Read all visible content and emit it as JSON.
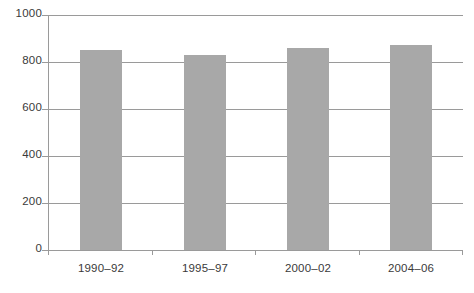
{
  "chart_data": {
    "type": "bar",
    "title": "",
    "subtitle": "",
    "xlabel": "",
    "ylabel": "",
    "categories": [
      "1990–92",
      "1995–97",
      "2000–02",
      "2004–06"
    ],
    "values": [
      850,
      830,
      860,
      872
    ],
    "ylim": [
      0,
      1000
    ],
    "y_ticks": [
      0,
      200,
      400,
      600,
      800,
      1000
    ],
    "y_tick_labels": [
      "0",
      "200",
      "400",
      "600",
      "800",
      "1000"
    ],
    "grid": true,
    "grid_axis": "y",
    "legend": false,
    "legend_position": "none",
    "bar_color": "#a8a8a8",
    "axis_color": "#9a9a9a",
    "text_color": "#3a3a3a",
    "background": "#ffffff"
  },
  "axes": {
    "y_tick_0": "0",
    "y_tick_1": "200",
    "y_tick_2": "400",
    "y_tick_3": "600",
    "y_tick_4": "800",
    "y_tick_5": "1000",
    "x_label_0": "1990–92",
    "x_label_1": "1995–97",
    "x_label_2": "2000–02",
    "x_label_3": "2004–06"
  }
}
